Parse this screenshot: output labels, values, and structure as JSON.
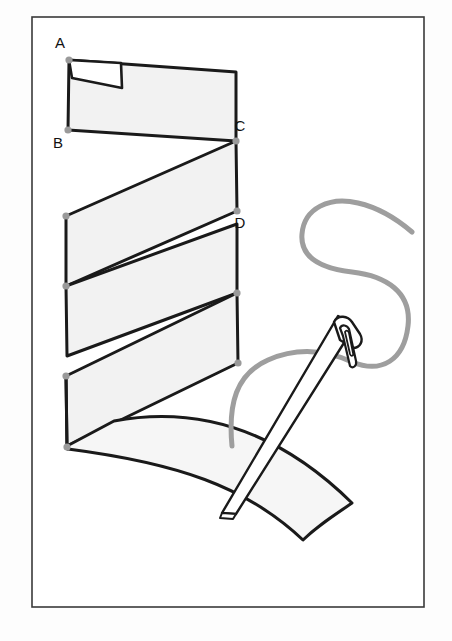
{
  "figure": {
    "canvas": {
      "width": 452,
      "height": 641
    },
    "background_color": "#fdfdfd",
    "frame": {
      "name": "figure-border",
      "x": 32,
      "y": 17,
      "width": 392,
      "height": 590,
      "stroke_color": "#3a3a3a",
      "fill_color": "#ffffff"
    },
    "strip": {
      "name": "folded-paper-strip",
      "fill_color": "#f2f2f2",
      "stroke_color": "#1a1a1a",
      "stroke_width": 3,
      "description": "Zigzag accordion-folded band running top-left to bottom-right with four visible panels and a curved tail"
    },
    "vertex_dots": {
      "fill_color": "#9a9a9a",
      "radius": 3.6
    },
    "labels": [
      {
        "id": "A",
        "text": "A",
        "x": 60,
        "y": 48,
        "anchor_x": 69,
        "anchor_y": 60
      },
      {
        "id": "B",
        "text": "B",
        "x": 58,
        "y": 148,
        "anchor_x": 68,
        "anchor_y": 130
      },
      {
        "id": "C",
        "text": "C",
        "x": 234,
        "y": 130,
        "anchor_x": 236,
        "anchor_y": 141
      },
      {
        "id": "D",
        "text": "D",
        "x": 233,
        "y": 228,
        "anchor_x": 237,
        "anchor_y": 211
      }
    ],
    "needle": {
      "name": "sewing-needle",
      "fill_color": "#ffffff",
      "stroke_color": "#1a1a1a",
      "stroke_width": 2.4,
      "eye_shape": "elongated-slot",
      "tip_point": {
        "x": 225,
        "y": 512
      },
      "head_point": {
        "x": 348,
        "y": 320
      }
    },
    "thread": {
      "name": "thread",
      "color": "#9e9e9e",
      "stroke_width": 5,
      "shape": "s-curve",
      "left_tail_end": {
        "x": 232,
        "y": 446
      },
      "right_tail_end": {
        "x": 412,
        "y": 232
      }
    }
  }
}
